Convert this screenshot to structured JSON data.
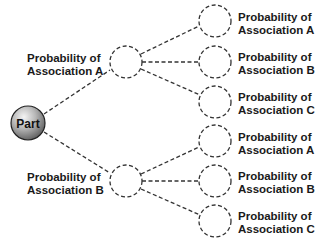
{
  "diagram": {
    "root": {
      "label": "Part"
    },
    "level1": [
      {
        "line1": "Probability of",
        "line2": "Association A"
      },
      {
        "line1": "Probability of",
        "line2": "Association B"
      }
    ],
    "level2": [
      {
        "line1": "Probability of",
        "line2": "Association A"
      },
      {
        "line1": "Probability of",
        "line2": "Association B"
      },
      {
        "line1": "Probability of",
        "line2": "Association C"
      },
      {
        "line1": "Probability of",
        "line2": "Association A"
      },
      {
        "line1": "Probability of",
        "line2": "Association B"
      },
      {
        "line1": "Probability of",
        "line2": "Association C"
      }
    ],
    "colors": {
      "line": "#333333",
      "node_fill_light": "#e8e8e8",
      "node_fill_dark": "#6e6e6e",
      "text": "#1a1a1a"
    }
  }
}
